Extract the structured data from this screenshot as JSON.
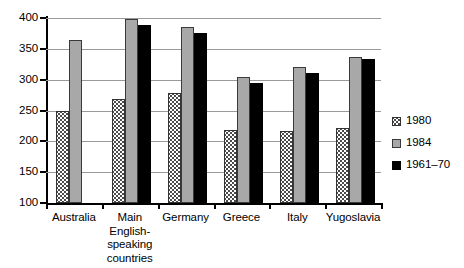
{
  "chart_data": {
    "type": "bar",
    "title": "",
    "subtitle": "",
    "xlabel": "",
    "ylabel": "",
    "ylim": [
      100,
      400
    ],
    "yticks": [
      100,
      150,
      200,
      250,
      300,
      350,
      400
    ],
    "grid": true,
    "legend_position": "right",
    "categories": [
      "Australia",
      "Main\nEnglish-\nspeaking\ncountries",
      "Germany",
      "Greece",
      "Italy",
      "Yugoslavia"
    ],
    "series": [
      {
        "name": "1980",
        "color": "#ffffff",
        "pattern": "dotted",
        "values": [
          250,
          268,
          278,
          218,
          216,
          222
        ]
      },
      {
        "name": "1984",
        "color": "#a8a8a8",
        "pattern": "solid",
        "values": [
          365,
          398,
          386,
          304,
          321,
          337
        ]
      },
      {
        "name": "1961-70",
        "color": "#000000",
        "pattern": "solid",
        "values": [
          null,
          388,
          375,
          295,
          311,
          334
        ]
      }
    ]
  },
  "axis": {
    "y_tick_labels": [
      "400",
      "350",
      "300",
      "250",
      "200",
      "150",
      "100"
    ]
  },
  "legend": {
    "entries": [
      {
        "label": "1980"
      },
      {
        "label": "1984"
      },
      {
        "label": "1961–70"
      }
    ]
  },
  "xaxis": {
    "labels": [
      "Australia",
      "Main\nEnglish-\nspeaking\ncountries",
      "Germany",
      "Greece",
      "Italy",
      "Yugoslavia"
    ]
  }
}
